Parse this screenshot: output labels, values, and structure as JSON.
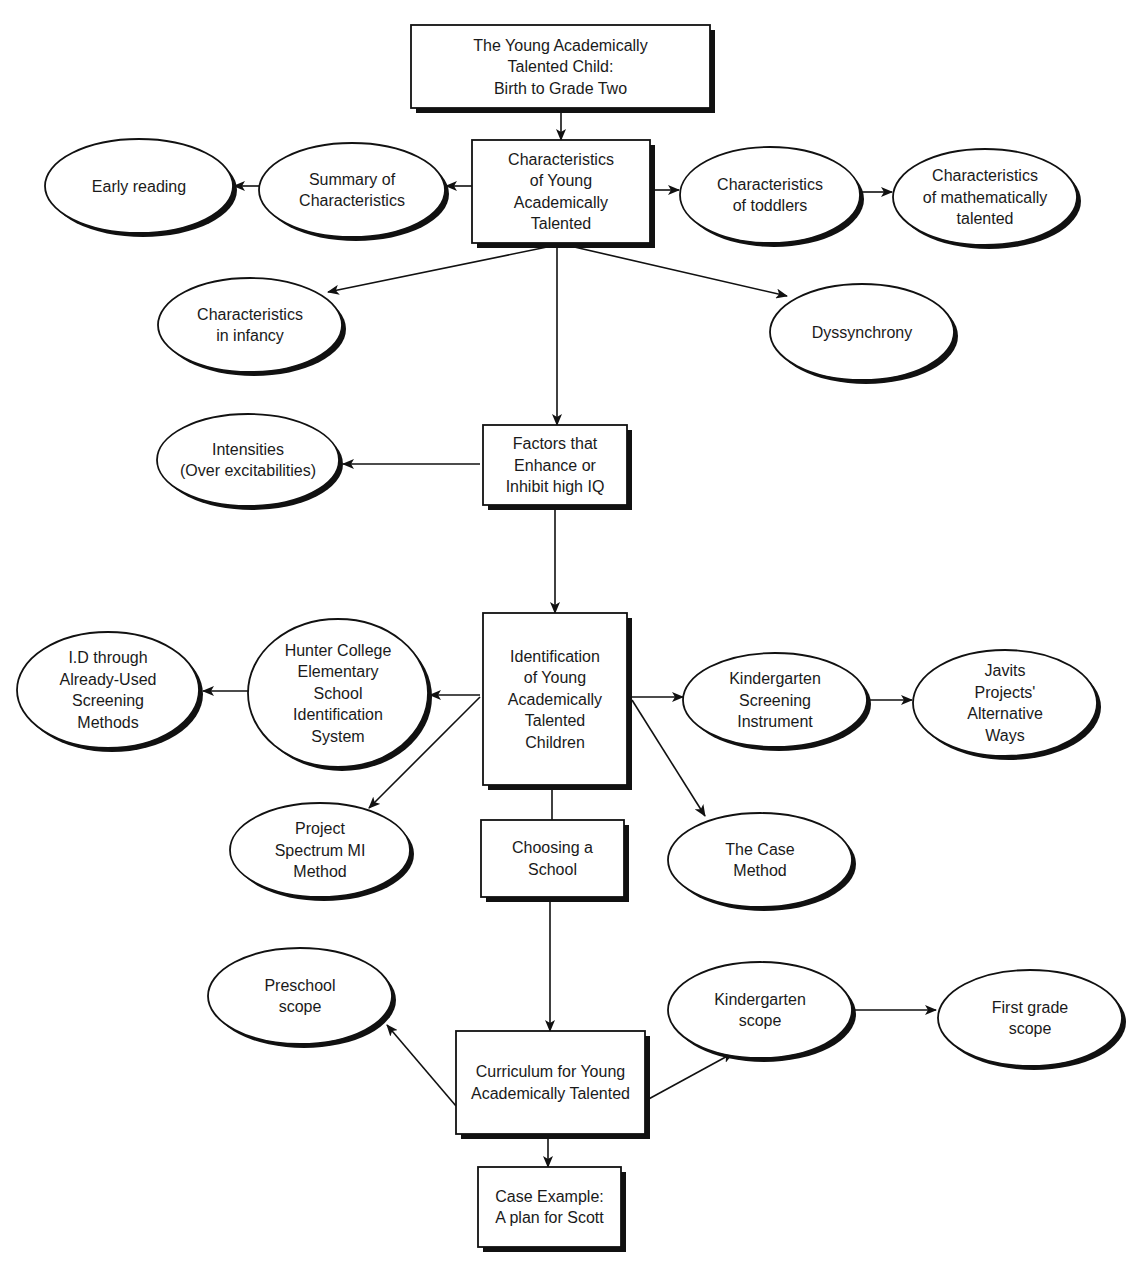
{
  "diagram": {
    "type": "concept-map",
    "colors": {
      "stroke": "#111111",
      "fill": "#ffffff",
      "text": "#1a1a1a"
    },
    "nodes": [
      {
        "id": "title",
        "shape": "box",
        "lines": [
          "The Young Academically",
          "Talented Child:",
          "Birth to Grade Two"
        ],
        "x": 411,
        "y": 25,
        "w": 299,
        "h": 83
      },
      {
        "id": "characteristics",
        "shape": "box",
        "lines": [
          "Characteristics",
          "of Young",
          "Academically",
          "Talented"
        ],
        "x": 472,
        "y": 140,
        "w": 178,
        "h": 103
      },
      {
        "id": "summary",
        "shape": "ellipse",
        "lines": [
          "Summary of",
          "Characteristics"
        ],
        "cx": 352,
        "cy": 190,
        "rx": 93,
        "ry": 47
      },
      {
        "id": "early-reading",
        "shape": "ellipse",
        "lines": [
          "Early reading"
        ],
        "cx": 139,
        "cy": 186,
        "rx": 94,
        "ry": 47
      },
      {
        "id": "toddlers",
        "shape": "ellipse",
        "lines": [
          "Characteristics",
          "of toddlers"
        ],
        "cx": 770,
        "cy": 195,
        "rx": 90,
        "ry": 48
      },
      {
        "id": "math-talented",
        "shape": "ellipse",
        "lines": [
          "Characteristics",
          "of mathematically",
          "talented"
        ],
        "cx": 985,
        "cy": 197,
        "rx": 92,
        "ry": 48
      },
      {
        "id": "infancy",
        "shape": "ellipse",
        "lines": [
          "Characteristics",
          "in infancy"
        ],
        "cx": 250,
        "cy": 325,
        "rx": 92,
        "ry": 47
      },
      {
        "id": "dyssynchrony",
        "shape": "ellipse",
        "lines": [
          "Dyssynchrony"
        ],
        "cx": 862,
        "cy": 332,
        "rx": 92,
        "ry": 48
      },
      {
        "id": "factors",
        "shape": "box",
        "lines": [
          "Factors that",
          "Enhance or",
          "Inhibit high IQ"
        ],
        "x": 483,
        "y": 425,
        "w": 144,
        "h": 80
      },
      {
        "id": "intensities",
        "shape": "ellipse",
        "lines": [
          "Intensities",
          "(Over excitabilities)"
        ],
        "cx": 248,
        "cy": 460,
        "rx": 91,
        "ry": 46
      },
      {
        "id": "identification",
        "shape": "box",
        "lines": [
          "Identification",
          "of Young",
          "Academically",
          "Talented",
          "Children"
        ],
        "x": 483,
        "y": 613,
        "w": 144,
        "h": 172
      },
      {
        "id": "hunter",
        "shape": "ellipse",
        "lines": [
          "Hunter College",
          "Elementary",
          "School",
          "Identification",
          "System"
        ],
        "cx": 338,
        "cy": 693,
        "rx": 90,
        "ry": 74
      },
      {
        "id": "id-screening",
        "shape": "ellipse",
        "lines": [
          "I.D through",
          "Already-Used",
          "Screening",
          "Methods"
        ],
        "cx": 108,
        "cy": 690,
        "rx": 91,
        "ry": 58
      },
      {
        "id": "kinder-screening",
        "shape": "ellipse",
        "lines": [
          "Kindergarten",
          "Screening",
          "Instrument"
        ],
        "cx": 775,
        "cy": 700,
        "rx": 92,
        "ry": 47
      },
      {
        "id": "javits",
        "shape": "ellipse",
        "lines": [
          "Javits",
          "Projects'",
          "Alternative",
          "Ways"
        ],
        "cx": 1005,
        "cy": 703,
        "rx": 92,
        "ry": 53
      },
      {
        "id": "project-spectrum",
        "shape": "ellipse",
        "lines": [
          "Project",
          "Spectrum MI",
          "Method"
        ],
        "cx": 320,
        "cy": 850,
        "rx": 90,
        "ry": 47
      },
      {
        "id": "choosing",
        "shape": "box",
        "lines": [
          "Choosing a",
          "School"
        ],
        "x": 481,
        "y": 820,
        "w": 143,
        "h": 77
      },
      {
        "id": "case-method",
        "shape": "ellipse",
        "lines": [
          "The Case",
          "Method"
        ],
        "cx": 760,
        "cy": 860,
        "rx": 92,
        "ry": 47
      },
      {
        "id": "preschool",
        "shape": "ellipse",
        "lines": [
          "Preschool",
          "scope"
        ],
        "cx": 300,
        "cy": 996,
        "rx": 92,
        "ry": 48
      },
      {
        "id": "kinder-scope",
        "shape": "ellipse",
        "lines": [
          "Kindergarten",
          "scope"
        ],
        "cx": 760,
        "cy": 1010,
        "rx": 92,
        "ry": 48
      },
      {
        "id": "first-grade",
        "shape": "ellipse",
        "lines": [
          "First grade",
          "scope"
        ],
        "cx": 1030,
        "cy": 1018,
        "rx": 92,
        "ry": 48
      },
      {
        "id": "curriculum",
        "shape": "box",
        "lines": [
          "Curriculum for Young",
          "Academically Talented"
        ],
        "x": 456,
        "y": 1031,
        "w": 189,
        "h": 103
      },
      {
        "id": "case-example",
        "shape": "box",
        "lines": [
          "Case Example:",
          "A plan for Scott"
        ],
        "x": 478,
        "y": 1167,
        "w": 143,
        "h": 80
      }
    ],
    "edges": [
      {
        "from": "title",
        "to": "characteristics",
        "points": [
          [
            561,
            108
          ],
          [
            561,
            140
          ]
        ],
        "arrow": true
      },
      {
        "from": "characteristics",
        "to": "summary",
        "points": [
          [
            472,
            186
          ],
          [
            446,
            186
          ]
        ],
        "arrow": true
      },
      {
        "from": "summary",
        "to": "early-reading",
        "points": [
          [
            259,
            186
          ],
          [
            234,
            186
          ]
        ],
        "arrow": true
      },
      {
        "from": "characteristics",
        "to": "toddlers",
        "points": [
          [
            650,
            190
          ],
          [
            679,
            190
          ]
        ],
        "arrow": true
      },
      {
        "from": "toddlers",
        "to": "math-talented",
        "points": [
          [
            860,
            192
          ],
          [
            892,
            192
          ]
        ],
        "arrow": true
      },
      {
        "from": "characteristics",
        "to": "infancy",
        "points": [
          [
            552,
            246
          ],
          [
            328,
            292
          ]
        ],
        "arrow": true
      },
      {
        "from": "characteristics",
        "to": "dyssynchrony",
        "points": [
          [
            570,
            246
          ],
          [
            787,
            296
          ]
        ],
        "arrow": true
      },
      {
        "from": "characteristics",
        "to": "factors",
        "points": [
          [
            557,
            243
          ],
          [
            557,
            425
          ]
        ],
        "arrow": true
      },
      {
        "from": "factors",
        "to": "intensities",
        "points": [
          [
            480,
            464
          ],
          [
            343,
            464
          ]
        ],
        "arrow": true
      },
      {
        "from": "factors",
        "to": "identification",
        "points": [
          [
            555,
            505
          ],
          [
            555,
            613
          ]
        ],
        "arrow": true
      },
      {
        "from": "identification",
        "to": "hunter",
        "points": [
          [
            480,
            695
          ],
          [
            430,
            695
          ]
        ],
        "arrow": true
      },
      {
        "from": "hunter",
        "to": "id-screening",
        "points": [
          [
            248,
            691
          ],
          [
            203,
            691
          ]
        ],
        "arrow": true
      },
      {
        "from": "identification",
        "to": "project-spectrum",
        "points": [
          [
            480,
            697
          ],
          [
            369,
            808
          ]
        ],
        "arrow": true
      },
      {
        "from": "identification",
        "to": "kinder-screening",
        "points": [
          [
            632,
            697
          ],
          [
            683,
            697
          ]
        ],
        "arrow": true
      },
      {
        "from": "kinder-screening",
        "to": "javits",
        "points": [
          [
            867,
            700
          ],
          [
            912,
            700
          ]
        ],
        "arrow": true
      },
      {
        "from": "identification",
        "to": "case-method",
        "points": [
          [
            632,
            700
          ],
          [
            705,
            816
          ]
        ],
        "arrow": true
      },
      {
        "from": "identification",
        "to": "choosing",
        "points": [
          [
            552,
            785
          ],
          [
            552,
            820
          ]
        ],
        "arrow": false
      },
      {
        "from": "choosing",
        "to": "curriculum",
        "points": [
          [
            550,
            897
          ],
          [
            550,
            1031
          ]
        ],
        "arrow": true
      },
      {
        "from": "curriculum",
        "to": "preschool",
        "points": [
          [
            456,
            1106
          ],
          [
            387,
            1025
          ]
        ],
        "arrow": true
      },
      {
        "from": "curriculum",
        "to": "kinder-scope",
        "points": [
          [
            645,
            1101
          ],
          [
            733,
            1053
          ]
        ],
        "arrow": true
      },
      {
        "from": "kinder-scope",
        "to": "first-grade",
        "points": [
          [
            852,
            1010
          ],
          [
            936,
            1010
          ]
        ],
        "arrow": true
      },
      {
        "from": "curriculum",
        "to": "case-example",
        "points": [
          [
            548,
            1134
          ],
          [
            548,
            1167
          ]
        ],
        "arrow": true
      }
    ]
  }
}
